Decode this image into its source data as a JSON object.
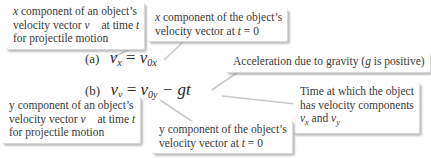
{
  "equations": [
    {
      "tag": "(a)",
      "lhs_var": "v",
      "lhs_sub": "x",
      "equals": "=",
      "rhs_var": "v",
      "rhs_sub": "0x",
      "rhs_rest": ""
    },
    {
      "tag": "(b)",
      "lhs_var": "v",
      "lhs_sub": "y",
      "equals": "=",
      "rhs_var": "v",
      "rhs_sub": "0y",
      "rhs_rest": "− gt"
    }
  ],
  "callouts": {
    "vx_def": {
      "line1_var": "x",
      "line1_text": " component of an object’s",
      "line2_text": "velocity vector ",
      "line2_vec": "v⃗",
      "line2_text_b": " at time ",
      "line2_t": "t",
      "line3_text": "for projectile motion"
    },
    "v0x_def": {
      "line1_var": "x",
      "line1_text": " component of the object’s",
      "line2_text": "velocity vector at ",
      "line2_t": "t",
      "line2_rest": " = 0"
    },
    "g_def": {
      "text_a": "Acceleration due to gravity (",
      "g": "g",
      "text_b": " is positive)"
    },
    "t_def": {
      "line1": "Time at which the object",
      "line2": "has velocity components",
      "line3_vx": "v",
      "line3_vx_sub": "x",
      "line3_and": " and ",
      "line3_vy": "v",
      "line3_vy_sub": "y"
    },
    "vy_def": {
      "line1_text": "y component of an object’s",
      "line2_text": "velocity vector ",
      "line2_vec": "v⃗",
      "line2_text_b": " at time ",
      "line2_t": "t",
      "line3_text": "for projectile motion"
    },
    "v0y_def": {
      "line1_text": "y component of the object’s",
      "line2_text": "velocity vector at ",
      "line2_t": "t",
      "line2_rest": " = 0"
    }
  },
  "colors": {
    "leader_line": "#c8c8c8",
    "callout_bg": "#ffffff",
    "text": "#3a3a3a"
  }
}
